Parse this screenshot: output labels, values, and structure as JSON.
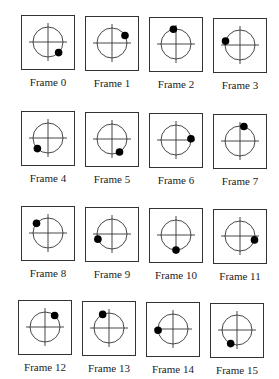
{
  "frames": [
    {
      "label": "Frame 0",
      "dot_angle_deg": 315
    },
    {
      "label": "Frame 1",
      "dot_angle_deg": 30
    },
    {
      "label": "Frame 2",
      "dot_angle_deg": 100
    },
    {
      "label": "Frame 3",
      "dot_angle_deg": 165
    },
    {
      "label": "Frame 4",
      "dot_angle_deg": 225
    },
    {
      "label": "Frame 5",
      "dot_angle_deg": 300
    },
    {
      "label": "Frame 6",
      "dot_angle_deg": 5
    },
    {
      "label": "Frame 7",
      "dot_angle_deg": 75
    },
    {
      "label": "Frame 8",
      "dot_angle_deg": 140
    },
    {
      "label": "Frame 9",
      "dot_angle_deg": 200
    },
    {
      "label": "Frame 10",
      "dot_angle_deg": 270
    },
    {
      "label": "Frame 11",
      "dot_angle_deg": 345
    },
    {
      "label": "Frame 12",
      "dot_angle_deg": 50
    },
    {
      "label": "Frame 13",
      "dot_angle_deg": 115
    },
    {
      "label": "Frame 14",
      "dot_angle_deg": 185
    },
    {
      "label": "Frame 15",
      "dot_angle_deg": 245
    }
  ],
  "colors": {
    "line": "#333333",
    "dot": "#000000"
  }
}
